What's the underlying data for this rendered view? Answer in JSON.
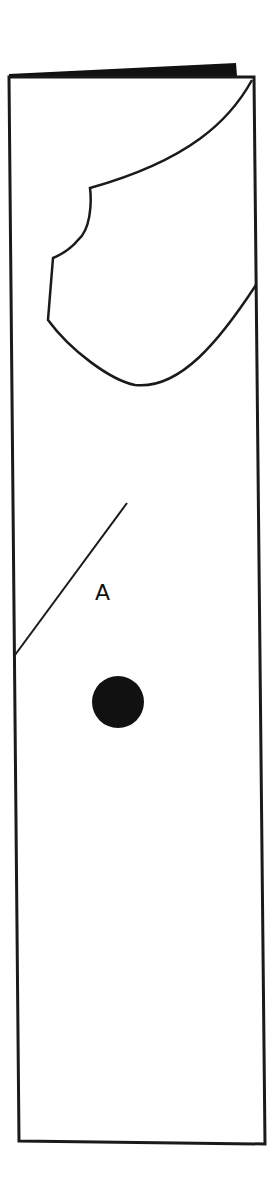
{
  "diagram": {
    "type": "paper folding / cut-out puzzle figure",
    "label": "A",
    "stroke_color": "#1a1a1a",
    "fill_color": "#111111",
    "background": "#ffffff",
    "elements": [
      {
        "name": "folded-paper-strip",
        "description": "tall rectangle representing a folded strip of paper"
      },
      {
        "name": "fold-edge-wedge",
        "description": "black wedge on top edge indicating the folded layer"
      },
      {
        "name": "cut-out-shape",
        "description": "irregular curved cut-out near the top right"
      },
      {
        "name": "diagonal-cut-line",
        "description": "straight diagonal line from left edge"
      },
      {
        "name": "label-a",
        "description": "letter A marking a region"
      },
      {
        "name": "punched-hole",
        "description": "solid black circle (hole)"
      }
    ]
  }
}
